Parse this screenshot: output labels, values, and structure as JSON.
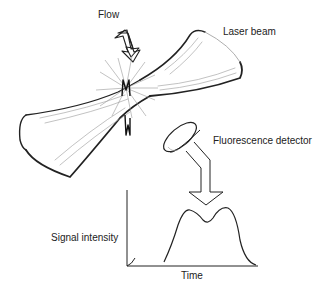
{
  "labels": {
    "flow": "Flow",
    "laser_beam": "Laser beam",
    "fluorescence_detector": "Fluorescence detector",
    "signal_intensity": "Signal intensity",
    "time": "Time"
  },
  "colors": {
    "ink": "#222222",
    "light_ink": "#999999",
    "background": "#ffffff"
  }
}
